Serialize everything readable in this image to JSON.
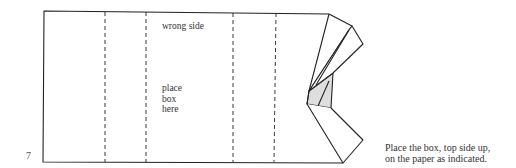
{
  "diagram": {
    "step_number": "7",
    "labels": {
      "wrong_side": "wrong side",
      "place_box_line1": "place",
      "place_box_line2": "box",
      "place_box_line3": "here"
    },
    "caption": {
      "line1": "Place the box, top side up,",
      "line2": "on the paper as indicated."
    },
    "colors": {
      "stroke": "#222222",
      "shade": "#dedede",
      "background": "#ffffff"
    }
  }
}
